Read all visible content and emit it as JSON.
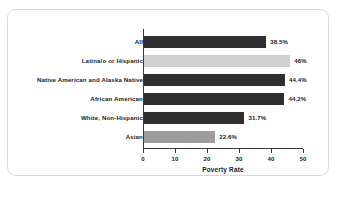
{
  "chart_data": {
    "type": "bar",
    "orientation": "horizontal",
    "title": "",
    "xlabel": "Poverty Rate",
    "ylabel": "",
    "xlim": [
      0,
      50
    ],
    "xticks": [
      "0",
      "10",
      "20",
      "30",
      "40",
      "50"
    ],
    "grid": false,
    "legend": "none",
    "categories": [
      "All",
      "Latina/o or Hispanic",
      "Native American and Alaska Native",
      "African American",
      "White, Non-Hispanic",
      "Asian"
    ],
    "values": [
      38.5,
      46,
      44.4,
      44.2,
      31.7,
      22.6
    ],
    "value_labels": [
      "38.5%",
      "46%",
      "44.4%",
      "44.2%",
      "31.7%",
      "22.6%"
    ],
    "bar_colors": [
      "#2f2f2f",
      "#cfcfcf",
      "#2f2f2f",
      "#2f2f2f",
      "#2f2f2f",
      "#9d9d9d"
    ],
    "bar_shades": [
      "dark",
      "light",
      "dark",
      "dark",
      "dark",
      "mid"
    ]
  },
  "style": {
    "frame_border_color": "#d8d8d8",
    "axis_color": "#3a3a3a",
    "text_color": "#1a1a1a",
    "background": "#ffffff"
  }
}
